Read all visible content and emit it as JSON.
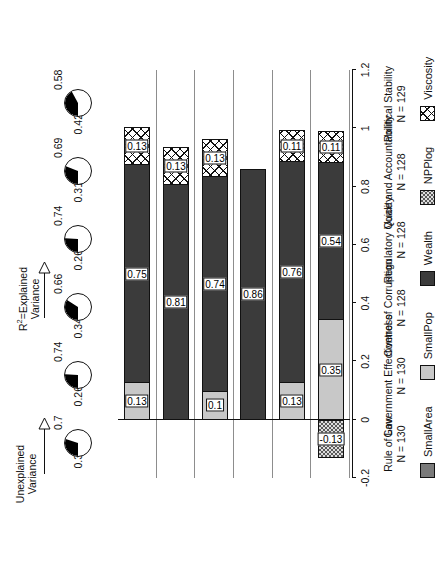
{
  "annotations": {
    "unexplained": "Unexplained\nVariance",
    "explained_pre": "R",
    "explained_sup": "2",
    "explained_post": "=Explained",
    "explained_line2": "Variance"
  },
  "legend": {
    "items": [
      {
        "label": "SmallArea",
        "fill": "f-smallarea",
        "color": "#7a7a7a"
      },
      {
        "label": "SmallPop",
        "fill": "f-smallpop",
        "color": "#c8c8c8"
      },
      {
        "label": "Wealth",
        "fill": "f-wealth",
        "color": "#3b3b3b"
      },
      {
        "label": "NPPlog",
        "fill": "f-npp",
        "color": "#5a5a5a"
      },
      {
        "label": "Viscosity",
        "fill": "f-visc",
        "color": "#ffffff"
      }
    ]
  },
  "chart_data": {
    "type": "bar",
    "title": "",
    "xlabel": "",
    "ylabel": "",
    "stacked": true,
    "orientation": "horizontal",
    "xlim": [
      -0.2,
      1.2
    ],
    "ticks": [
      "-0.2",
      "0",
      "0.2",
      "0.4",
      "0.6",
      "0.8",
      "1",
      "1.2"
    ],
    "tick_values": [
      -0.2,
      0,
      0.2,
      0.4,
      0.6,
      0.8,
      1,
      1.2
    ],
    "grid": false,
    "legend_position": "bottom",
    "series": [
      {
        "name": "SmallArea",
        "values": [
          0,
          0,
          0,
          0,
          0,
          0
        ]
      },
      {
        "name": "SmallPop",
        "values": [
          0.13,
          0,
          0.1,
          0,
          0.13,
          0.35
        ]
      },
      {
        "name": "Wealth",
        "values": [
          0.75,
          0.81,
          0.74,
          0.86,
          0.76,
          0.54
        ]
      },
      {
        "name": "NPPlog",
        "values": [
          0,
          0,
          0,
          0,
          0,
          -0.13
        ]
      },
      {
        "name": "Viscosity",
        "values": [
          0.13,
          0.13,
          0.13,
          0,
          0.11,
          0.11
        ]
      }
    ],
    "categories": [
      {
        "label": "Rule of Law",
        "n": "N = 130"
      },
      {
        "label": "Government Effectiveness",
        "n": "N = 130"
      },
      {
        "label": "Control of Corruption",
        "n": "N = 128"
      },
      {
        "label": "Regulatory Quality",
        "n": "N = 128"
      },
      {
        "label": "Voice and Accountability",
        "n": "N = 128"
      },
      {
        "label": "Political Stability",
        "n": "N = 129"
      }
    ],
    "bars": [
      {
        "category": "Rule of Law",
        "segments": [
          {
            "series": "SmallPop",
            "value": 0.13,
            "label": "0.13",
            "fill": "f-smallpop"
          },
          {
            "series": "Wealth",
            "value": 0.75,
            "label": "0.75",
            "fill": "f-wealth"
          },
          {
            "series": "Viscosity",
            "value": 0.13,
            "label": "0.13",
            "fill": "f-visc"
          }
        ]
      },
      {
        "category": "Government Effectiveness",
        "segments": [
          {
            "series": "Wealth",
            "value": 0.81,
            "label": "0.81",
            "fill": "f-wealth"
          },
          {
            "series": "Viscosity",
            "value": 0.13,
            "label": "0.13",
            "fill": "f-visc"
          }
        ]
      },
      {
        "category": "Control of Corruption",
        "segments": [
          {
            "series": "SmallPop",
            "value": 0.1,
            "label": "0.1",
            "fill": "f-smallpop"
          },
          {
            "series": "Wealth",
            "value": 0.74,
            "label": "0.74",
            "fill": "f-wealth"
          },
          {
            "series": "Viscosity",
            "value": 0.13,
            "label": "0.13",
            "fill": "f-visc"
          }
        ]
      },
      {
        "category": "Regulatory Quality",
        "segments": [
          {
            "series": "Wealth",
            "value": 0.86,
            "label": "0.86",
            "fill": "f-wealth"
          }
        ]
      },
      {
        "category": "Voice and Accountability",
        "segments": [
          {
            "series": "SmallPop",
            "value": 0.13,
            "label": "0.13",
            "fill": "f-smallpop"
          },
          {
            "series": "Wealth",
            "value": 0.76,
            "label": "0.76",
            "fill": "f-wealth"
          },
          {
            "series": "Viscosity",
            "value": 0.11,
            "label": "0.11",
            "fill": "f-visc"
          }
        ]
      },
      {
        "category": "Political Stability",
        "segments": [
          {
            "series": "NPPlog",
            "value": -0.13,
            "label": "-0.13",
            "fill": "f-npp"
          },
          {
            "series": "SmallPop",
            "value": 0.35,
            "label": "0.35",
            "fill": "f-smallpop"
          },
          {
            "series": "Wealth",
            "value": 0.54,
            "label": "0.54",
            "fill": "f-wealth"
          },
          {
            "series": "Viscosity",
            "value": 0.11,
            "label": "0.11",
            "fill": "f-visc"
          }
        ]
      }
    ],
    "variance": [
      {
        "category": "Rule of Law",
        "unexplained": "0.3",
        "explained": "0.7",
        "unexplained_value": 0.3,
        "explained_value": 0.7
      },
      {
        "category": "Government Effectiveness",
        "unexplained": "0.26",
        "explained": "0.74",
        "unexplained_value": 0.26,
        "explained_value": 0.74
      },
      {
        "category": "Control of Corruption",
        "unexplained": "0.34",
        "explained": "0.66",
        "unexplained_value": 0.34,
        "explained_value": 0.66
      },
      {
        "category": "Regulatory Quality",
        "unexplained": "0.26",
        "explained": "0.74",
        "unexplained_value": 0.26,
        "explained_value": 0.74
      },
      {
        "category": "Voice and Accountability",
        "unexplained": "0.31",
        "explained": "0.69",
        "unexplained_value": 0.31,
        "explained_value": 0.69
      },
      {
        "category": "Political Stability",
        "unexplained": "0.42",
        "explained": "0.58",
        "unexplained_value": 0.42,
        "explained_value": 0.58
      }
    ]
  }
}
